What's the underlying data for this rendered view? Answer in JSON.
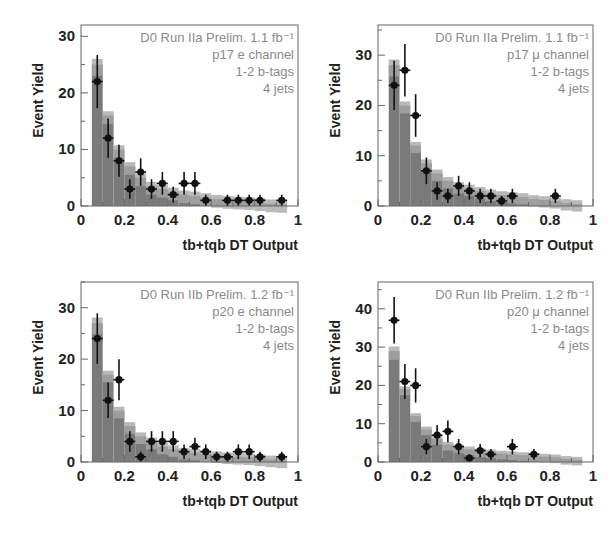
{
  "figure": {
    "background": "#ffffff",
    "colors": {
      "frame": "#666666",
      "stack_fill": "#7a7a7a",
      "stack_band": "#a8a8a8",
      "data_marker": "#111111",
      "annotation": "#8a8a8a",
      "axis_text": "#222222"
    }
  },
  "chart_data": [
    {
      "type": "bar",
      "subtype": "histogram-with-data-points",
      "panel": "top-left",
      "xlabel": "tb+tqb DT Output",
      "ylabel": "Event Yield",
      "xlim": [
        0,
        1
      ],
      "ylim": [
        0,
        32
      ],
      "xticks": [
        "0",
        "0.2",
        "0.4",
        "0.6",
        "0.8",
        "1"
      ],
      "yticks": [
        "0",
        "10",
        "20",
        "30"
      ],
      "annotation": [
        "D0 Run IIa Prelim. 1.1 fb⁻¹",
        "p17 e channel",
        "1-2 b-tags",
        "4 jets"
      ],
      "bin_edges": [
        0.05,
        0.1,
        0.15,
        0.2,
        0.25,
        0.3,
        0.35,
        0.4,
        0.45,
        0.5,
        0.55,
        0.6,
        0.65,
        0.7,
        0.75,
        0.8,
        0.85,
        0.9,
        0.95
      ],
      "prediction": [
        25,
        16,
        10,
        7,
        5,
        3.5,
        3,
        2.5,
        2,
        1.8,
        1.5,
        1.2,
        1,
        0.9,
        0.8,
        0.6,
        0.4,
        0.3
      ],
      "data_x": [
        0.075,
        0.125,
        0.175,
        0.225,
        0.275,
        0.325,
        0.375,
        0.425,
        0.475,
        0.525,
        0.575,
        0.675,
        0.725,
        0.775,
        0.825,
        0.925
      ],
      "data_y": [
        22,
        12,
        8,
        3,
        6,
        3,
        4,
        2,
        4,
        4,
        1,
        1,
        1,
        1,
        1,
        1
      ],
      "grid": false,
      "legend": "none"
    },
    {
      "type": "bar",
      "subtype": "histogram-with-data-points",
      "panel": "top-right",
      "xlabel": "tb+tqb DT Output",
      "ylabel": "Event Yield",
      "xlim": [
        0,
        1
      ],
      "ylim": [
        0,
        36
      ],
      "xticks": [
        "0",
        "0.2",
        "0.4",
        "0.6",
        "0.8",
        "1"
      ],
      "yticks": [
        "0",
        "10",
        "20",
        "30"
      ],
      "annotation": [
        "D0 Run IIa Prelim. 1.1 fb⁻¹",
        "p17 μ channel",
        "1-2 b-tags",
        "4 jets"
      ],
      "bin_edges": [
        0.05,
        0.1,
        0.15,
        0.2,
        0.25,
        0.3,
        0.35,
        0.4,
        0.45,
        0.5,
        0.55,
        0.6,
        0.65,
        0.7,
        0.75,
        0.8,
        0.85,
        0.9,
        0.95
      ],
      "prediction": [
        28,
        20,
        12,
        8.5,
        6.5,
        5,
        4,
        3.5,
        3,
        2.5,
        2.2,
        2,
        1.8,
        1.4,
        1.2,
        1,
        0.6,
        0.4
      ],
      "data_x": [
        0.075,
        0.125,
        0.175,
        0.225,
        0.275,
        0.325,
        0.375,
        0.425,
        0.475,
        0.525,
        0.575,
        0.625,
        0.825
      ],
      "data_y": [
        24,
        27,
        18,
        7,
        3,
        2,
        4,
        3,
        2,
        2,
        1,
        2,
        2
      ],
      "grid": false,
      "legend": "none"
    },
    {
      "type": "bar",
      "subtype": "histogram-with-data-points",
      "panel": "bottom-left",
      "xlabel": "tb+tqb DT Output",
      "ylabel": "Event Yield",
      "xlim": [
        0,
        1
      ],
      "ylim": [
        0,
        35
      ],
      "xticks": [
        "0",
        "0.2",
        "0.4",
        "0.6",
        "0.8",
        "1"
      ],
      "yticks": [
        "0",
        "10",
        "20",
        "30"
      ],
      "annotation": [
        "D0 Run IIb Prelim. 1.2 fb⁻¹",
        "p20 e channel",
        "1-2 b-tags",
        "4 jets"
      ],
      "bin_edges": [
        0.05,
        0.1,
        0.15,
        0.2,
        0.25,
        0.3,
        0.35,
        0.4,
        0.45,
        0.5,
        0.55,
        0.6,
        0.65,
        0.7,
        0.75,
        0.8,
        0.85,
        0.9,
        0.95
      ],
      "prediction": [
        27,
        17,
        10,
        7,
        5,
        4,
        3,
        2.5,
        2,
        1.8,
        1.5,
        1.3,
        1.1,
        1,
        0.9,
        0.7,
        0.5,
        0.3
      ],
      "data_x": [
        0.075,
        0.125,
        0.175,
        0.225,
        0.275,
        0.325,
        0.375,
        0.425,
        0.475,
        0.525,
        0.575,
        0.625,
        0.675,
        0.725,
        0.775,
        0.825,
        0.925
      ],
      "data_y": [
        24,
        12,
        16,
        4,
        1,
        4,
        4,
        4,
        2,
        3,
        2,
        1,
        1,
        2,
        2,
        1,
        1
      ],
      "grid": false,
      "legend": "none"
    },
    {
      "type": "bar",
      "subtype": "histogram-with-data-points",
      "panel": "bottom-right",
      "xlabel": "tb+tqb DT Output",
      "ylabel": "Event Yield",
      "xlim": [
        0,
        1
      ],
      "ylim": [
        0,
        47
      ],
      "xticks": [
        "0",
        "0.2",
        "0.4",
        "0.6",
        "0.8",
        "1"
      ],
      "yticks": [
        "0",
        "10",
        "20",
        "30",
        "40"
      ],
      "annotation": [
        "D0 Run IIb Prelim. 1.2 fb⁻¹",
        "p20 μ channel",
        "1-2 b-tags",
        "4 jets"
      ],
      "bin_edges": [
        0.05,
        0.1,
        0.15,
        0.2,
        0.25,
        0.3,
        0.35,
        0.4,
        0.45,
        0.5,
        0.55,
        0.6,
        0.65,
        0.7,
        0.75,
        0.8,
        0.85,
        0.9,
        0.95
      ],
      "prediction": [
        29,
        19,
        12,
        8.5,
        6,
        4.5,
        3.8,
        3.3,
        2.8,
        2.5,
        2.2,
        2,
        1.8,
        1.6,
        1.4,
        1.2,
        0.8,
        0.6
      ],
      "data_x": [
        0.075,
        0.125,
        0.175,
        0.225,
        0.275,
        0.325,
        0.375,
        0.425,
        0.475,
        0.525,
        0.625,
        0.725
      ],
      "data_y": [
        37,
        21,
        20,
        4,
        7,
        8,
        4,
        1,
        3,
        2,
        4,
        2
      ],
      "grid": false,
      "legend": "none"
    }
  ],
  "panels": [
    {
      "frame": {
        "x": 81,
        "y": 25,
        "w": 217,
        "h": 181
      }
    },
    {
      "frame": {
        "x": 378,
        "y": 25,
        "w": 215,
        "h": 181
      }
    },
    {
      "frame": {
        "x": 81,
        "y": 282,
        "w": 217,
        "h": 180
      }
    },
    {
      "frame": {
        "x": 378,
        "y": 282,
        "w": 215,
        "h": 180
      }
    }
  ]
}
